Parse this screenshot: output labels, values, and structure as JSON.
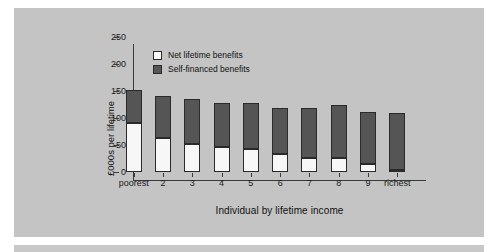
{
  "figure": {
    "panel_color": "#c4c4c4",
    "background_color": "#ffffff"
  },
  "chart_data": {
    "type": "bar",
    "stacked": true,
    "title": "",
    "xlabel": "Individual by lifetime income",
    "ylabel": "£000s per lifetime",
    "ylim": [
      0,
      250
    ],
    "yticks": [
      0,
      50,
      100,
      150,
      200,
      250
    ],
    "ytick_labels": [
      "0",
      "50",
      "100",
      "150",
      "200",
      "250"
    ],
    "grid": false,
    "legend_position": "upper-left-inside",
    "categories": [
      "poorest",
      "2",
      "3",
      "4",
      "5",
      "6",
      "7",
      "8",
      "9",
      "richest"
    ],
    "series": [
      {
        "name": "Net lifetime benefits",
        "color": "#f7f7f7",
        "values": [
          90,
          63,
          52,
          46,
          43,
          33,
          26,
          25,
          14,
          4
        ]
      },
      {
        "name": "Self-financed benefits",
        "color": "#555555",
        "values": [
          62,
          77,
          84,
          82,
          85,
          85,
          92,
          99,
          97,
          106
        ]
      }
    ],
    "totals": [
      152,
      140,
      136,
      128,
      128,
      118,
      118,
      124,
      111,
      110
    ]
  }
}
